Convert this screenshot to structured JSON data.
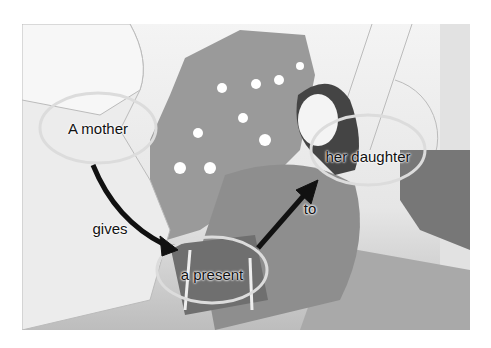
{
  "diagram": {
    "labels": {
      "subject": "A mother",
      "verb": "gives",
      "object": "a present",
      "preposition": "to",
      "recipient": "her daughter"
    },
    "colors": {
      "arrow": "#111111",
      "ellipse": "#dcdcdc",
      "tree": "#9a9a9a",
      "chair": "#8c8c8c",
      "floor": "#a8a8a8"
    }
  }
}
